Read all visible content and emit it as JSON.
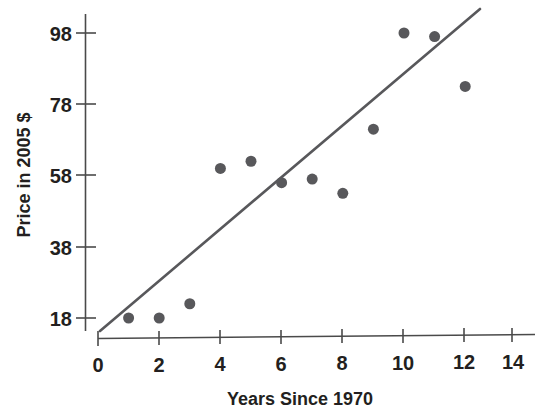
{
  "chart_data": {
    "type": "scatter",
    "title": "",
    "xlabel": "Years Since 1970",
    "ylabel": "Price in 2005 $",
    "xlim": [
      0,
      14.8
    ],
    "ylim": [
      14,
      101
    ],
    "xticks": [
      0,
      2,
      4,
      6,
      8,
      10,
      12,
      14
    ],
    "xtick_labels": [
      "0",
      "2",
      "4",
      "6",
      "8",
      "10",
      "12",
      "14"
    ],
    "yticks": [
      18,
      38,
      58,
      78,
      98
    ],
    "ytick_labels": [
      "18",
      "38",
      "58",
      "78",
      "98"
    ],
    "grid": false,
    "legend": null,
    "x": [
      1,
      2,
      3,
      4,
      5,
      6,
      7,
      8,
      9,
      10,
      11,
      12
    ],
    "y": [
      18,
      18,
      22,
      60,
      62,
      56,
      57,
      53,
      71,
      98,
      97,
      83
    ],
    "points": [
      {
        "x": 1,
        "y": 18
      },
      {
        "x": 2,
        "y": 18
      },
      {
        "x": 3,
        "y": 22
      },
      {
        "x": 4,
        "y": 60
      },
      {
        "x": 5,
        "y": 62
      },
      {
        "x": 6,
        "y": 56
      },
      {
        "x": 7,
        "y": 57
      },
      {
        "x": 8,
        "y": 53
      },
      {
        "x": 9,
        "y": 71
      },
      {
        "x": 10,
        "y": 98
      },
      {
        "x": 11,
        "y": 97
      },
      {
        "x": 12,
        "y": 83
      }
    ],
    "series": [
      {
        "name": "Price observations",
        "type": "scatter",
        "marker_color": "#58585b",
        "marker_size": 11,
        "values": [
          18,
          18,
          22,
          60,
          62,
          56,
          57,
          53,
          71,
          98,
          97,
          83
        ]
      },
      {
        "name": "Trend line",
        "type": "line",
        "line_color": "#58585b",
        "x_start": 0.07,
        "y_start": 14.3,
        "x_end": 12.45,
        "y_end": 104.8
      }
    ],
    "colors": {
      "marker": "#58585b",
      "line": "#58585b",
      "axis": "#4a4a4a",
      "text": "#231f20",
      "background": "#ffffff"
    }
  }
}
